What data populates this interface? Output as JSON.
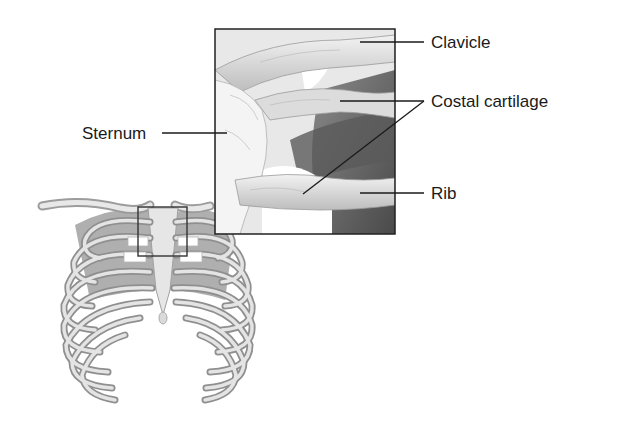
{
  "figure": {
    "type": "anatomical-illustration",
    "labels": {
      "clavicle": "Clavicle",
      "costal_cartilage": "Costal cartilage",
      "sternum": "Sternum",
      "rib": "Rib"
    },
    "colors": {
      "line": "#1a1a1a",
      "bone": "#d9d9d9",
      "shadow": "#7a7a7a",
      "background": "#ffffff"
    }
  }
}
